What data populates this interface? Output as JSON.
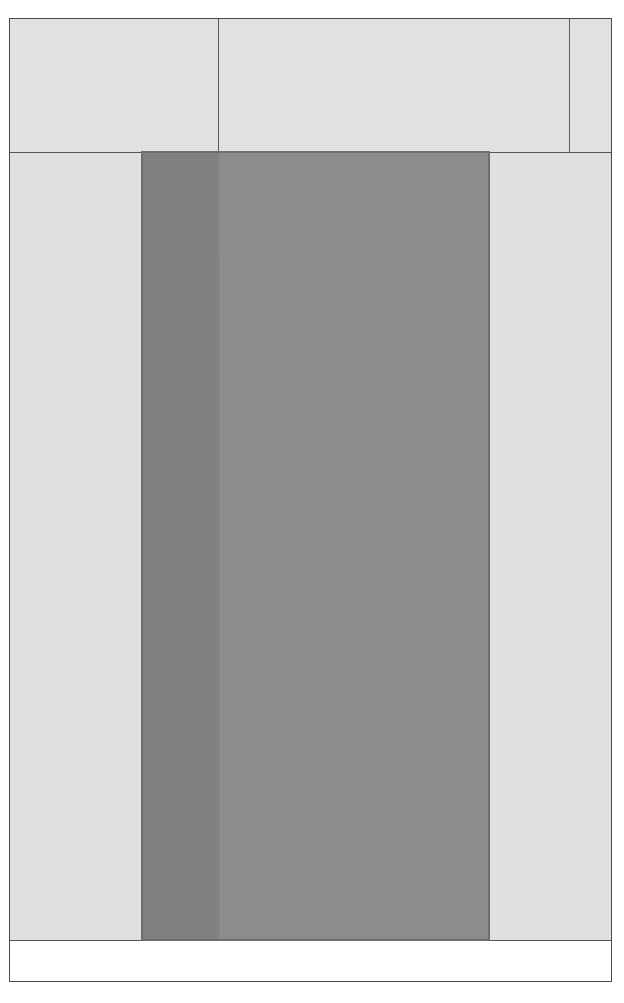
{
  "capture": {
    "width": 624,
    "height": 1003,
    "background_color": "#ffffff"
  },
  "frame": {
    "name": "document-frame",
    "border_color": "#4a4a4a",
    "background_color": "#ffffff"
  },
  "header": {
    "background_color": "#e4e4e4",
    "divider_color": "#5a5a5a",
    "cells": [
      {
        "id": "header-cell-left",
        "label": ""
      },
      {
        "id": "header-cell-center",
        "label": ""
      },
      {
        "id": "header-cell-right",
        "label": ""
      }
    ]
  },
  "body": {
    "background_color": "#e3e3e3",
    "label": ""
  },
  "footer": {
    "background_color": "#ffffff",
    "label": ""
  },
  "selection": {
    "name": "selection-overlay",
    "fill_color": "#8d8d8d",
    "accent_color": "#818181",
    "border_color": "#6e6e6e",
    "primary_label": "",
    "secondary_label": ""
  }
}
